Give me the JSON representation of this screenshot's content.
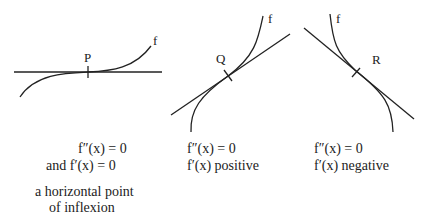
{
  "panels": [
    {
      "point_label": "P",
      "curve_label": "f",
      "lines": [
        "f″(x) = 0",
        "and   f′(x) = 0"
      ],
      "description": [
        "a horizontal point",
        "of inflexion"
      ]
    },
    {
      "point_label": "Q",
      "curve_label": "f",
      "lines": [
        "f″(x) = 0",
        "f′(x)  positive"
      ]
    },
    {
      "point_label": "R",
      "curve_label": "f",
      "lines": [
        "f″(x) = 0",
        "f′(x)  negative"
      ]
    }
  ]
}
